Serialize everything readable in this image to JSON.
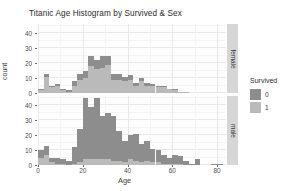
{
  "chart_data": {
    "type": "bar",
    "title": "Titanic Age Histogram by Survived & Sex",
    "xlabel": "Age",
    "ylabel": "count",
    "xlim": [
      0,
      84
    ],
    "ylim": [
      0,
      46
    ],
    "grid": true,
    "legend_position": "right",
    "stacked": true,
    "binwidth": 2.5,
    "x_ticks": [
      0,
      20,
      40,
      60,
      80
    ],
    "y_ticks": [
      0,
      10,
      20,
      30,
      40
    ],
    "legend": {
      "title": "Survived",
      "entries": [
        {
          "label": "0",
          "color": "#8d8d8d"
        },
        {
          "label": "1",
          "color": "#bababa"
        }
      ]
    },
    "facets": [
      {
        "label": "female",
        "y_ticks": [
          0,
          10,
          20,
          30,
          40
        ],
        "bins": [
          {
            "x": 1.25,
            "died": 1,
            "survived": 2
          },
          {
            "x": 3.75,
            "died": 2,
            "survived": 11
          },
          {
            "x": 6.25,
            "died": 1,
            "survived": 4
          },
          {
            "x": 8.75,
            "died": 1,
            "survived": 5
          },
          {
            "x": 11.25,
            "died": 1,
            "survived": 2
          },
          {
            "x": 13.75,
            "died": 1,
            "survived": 1
          },
          {
            "x": 16.25,
            "died": 3,
            "survived": 5
          },
          {
            "x": 18.75,
            "died": 4,
            "survived": 9
          },
          {
            "x": 21.25,
            "died": 5,
            "survived": 10
          },
          {
            "x": 23.75,
            "died": 7,
            "survived": 18
          },
          {
            "x": 26.25,
            "died": 6,
            "survived": 16
          },
          {
            "x": 28.75,
            "died": 8,
            "survived": 17
          },
          {
            "x": 31.25,
            "died": 6,
            "survived": 19
          },
          {
            "x": 33.75,
            "died": 4,
            "survived": 9
          },
          {
            "x": 36.25,
            "died": 4,
            "survived": 9
          },
          {
            "x": 38.75,
            "died": 3,
            "survived": 8
          },
          {
            "x": 41.25,
            "died": 3,
            "survived": 9
          },
          {
            "x": 43.75,
            "died": 2,
            "survived": 5
          },
          {
            "x": 46.25,
            "died": 2,
            "survived": 8
          },
          {
            "x": 48.75,
            "died": 2,
            "survived": 5
          },
          {
            "x": 51.25,
            "died": 1,
            "survived": 5
          },
          {
            "x": 53.75,
            "died": 1,
            "survived": 4
          },
          {
            "x": 56.25,
            "died": 1,
            "survived": 4
          },
          {
            "x": 58.75,
            "died": 0,
            "survived": 3
          },
          {
            "x": 61.25,
            "died": 1,
            "survived": 2
          },
          {
            "x": 63.75,
            "died": 0,
            "survived": 1
          },
          {
            "x": 66.25,
            "died": 0,
            "survived": 1
          }
        ]
      },
      {
        "label": "male",
        "y_ticks": [
          0,
          10,
          20,
          30,
          40
        ],
        "bins": [
          {
            "x": 1.25,
            "died": 5,
            "survived": 5
          },
          {
            "x": 3.75,
            "died": 6,
            "survived": 7
          },
          {
            "x": 6.25,
            "died": 3,
            "survived": 2
          },
          {
            "x": 8.75,
            "died": 4,
            "survived": 1
          },
          {
            "x": 11.25,
            "died": 3,
            "survived": 1
          },
          {
            "x": 13.75,
            "died": 3,
            "survived": 0
          },
          {
            "x": 16.25,
            "died": 11,
            "survived": 1
          },
          {
            "x": 18.75,
            "died": 22,
            "survived": 2
          },
          {
            "x": 21.25,
            "died": 41,
            "survived": 4
          },
          {
            "x": 23.75,
            "died": 35,
            "survived": 4
          },
          {
            "x": 26.25,
            "died": 41,
            "survived": 4
          },
          {
            "x": 28.75,
            "died": 29,
            "survived": 4
          },
          {
            "x": 31.25,
            "died": 31,
            "survived": 4
          },
          {
            "x": 33.75,
            "died": 30,
            "survived": 3
          },
          {
            "x": 36.25,
            "died": 20,
            "survived": 3
          },
          {
            "x": 38.75,
            "died": 14,
            "survived": 2
          },
          {
            "x": 41.25,
            "died": 16,
            "survived": 4
          },
          {
            "x": 43.75,
            "died": 18,
            "survived": 3
          },
          {
            "x": 46.25,
            "died": 12,
            "survived": 2
          },
          {
            "x": 48.75,
            "died": 13,
            "survived": 3
          },
          {
            "x": 51.25,
            "died": 9,
            "survived": 2
          },
          {
            "x": 53.75,
            "died": 8,
            "survived": 2
          },
          {
            "x": 56.25,
            "died": 6,
            "survived": 1
          },
          {
            "x": 58.75,
            "died": 4,
            "survived": 1
          },
          {
            "x": 61.25,
            "died": 6,
            "survived": 1
          },
          {
            "x": 63.75,
            "died": 5,
            "survived": 1
          },
          {
            "x": 66.25,
            "died": 3,
            "survived": 0
          },
          {
            "x": 68.75,
            "died": 1,
            "survived": 0
          },
          {
            "x": 71.25,
            "died": 4,
            "survived": 0
          },
          {
            "x": 73.75,
            "died": 0,
            "survived": 0
          },
          {
            "x": 76.25,
            "died": 0,
            "survived": 0
          },
          {
            "x": 78.75,
            "died": 1,
            "survived": 0
          },
          {
            "x": 81.25,
            "died": 1,
            "survived": 0
          }
        ]
      }
    ]
  }
}
